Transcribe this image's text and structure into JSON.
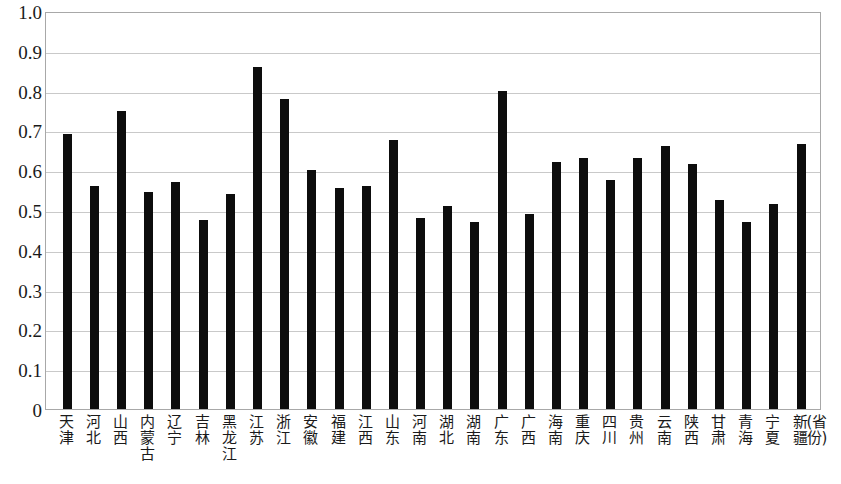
{
  "chart_data": {
    "type": "bar",
    "title": "",
    "subtitle": "",
    "xlabel": "(省份)",
    "ylabel": "",
    "ylim": [
      0,
      1.0
    ],
    "grid": true,
    "legend": null,
    "bar_color": "#0d0d0d",
    "gridline_color": "#c9c9c9",
    "axis_border_color": "#a8a8a8",
    "background_color": "#ffffff",
    "y_ticks": [
      "0",
      "0.1",
      "0.2",
      "0.3",
      "0.4",
      "0.5",
      "0.6",
      "0.7",
      "0.8",
      "0.9",
      "1.0"
    ],
    "y_tick_values": [
      0,
      0.1,
      0.2,
      0.3,
      0.4,
      0.5,
      0.6,
      0.7,
      0.8,
      0.9,
      1.0
    ],
    "categories": [
      "天津",
      "河北",
      "山西",
      "内蒙古",
      "辽宁",
      "吉林",
      "黑龙江",
      "江苏",
      "浙江",
      "安徽",
      "福建",
      "江西",
      "山东",
      "河南",
      "湖北",
      "湖南",
      "广东",
      "广西",
      "海南",
      "重庆",
      "四川",
      "贵州",
      "云南",
      "陕西",
      "甘肃",
      "青海",
      "宁夏",
      "新疆"
    ],
    "values": [
      0.69,
      0.56,
      0.75,
      0.545,
      0.57,
      0.475,
      0.54,
      0.86,
      0.78,
      0.6,
      0.555,
      0.56,
      0.675,
      0.48,
      0.51,
      0.47,
      0.8,
      0.49,
      0.62,
      0.63,
      0.575,
      0.63,
      0.66,
      0.615,
      0.525,
      0.47,
      0.515,
      0.665
    ]
  }
}
